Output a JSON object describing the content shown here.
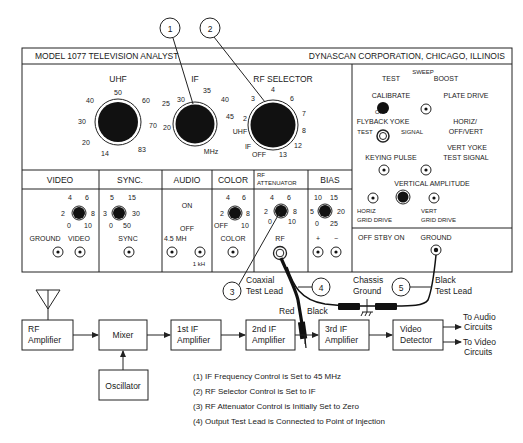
{
  "panel": {
    "model_title": "MODEL 1077 TELEVISION ANALYST",
    "maker": "DYNASCAN CORPORATION, CHICAGO, ILLINOIS",
    "uhf_dial": {
      "label": "UHF",
      "ticks": [
        "14",
        "20",
        "30",
        "40",
        "50",
        "60",
        "70",
        "83"
      ]
    },
    "if_dial": {
      "label": "IF",
      "unit": "MHz",
      "ticks": [
        "20",
        "25",
        "30",
        "35",
        "40",
        "45"
      ]
    },
    "rf_selector": {
      "label": "RF SELECTOR",
      "ticks": [
        "IF",
        "UHF",
        "2",
        "3",
        "4",
        "6",
        "7",
        "8",
        "12",
        "13"
      ],
      "off": "OFF"
    },
    "right_column": {
      "sweep": "SWEEP",
      "test": "TEST",
      "boost": "BOOST",
      "calibrate": "CALIBRATE",
      "plate_drive": "PLATE DRIVE",
      "off": "OFF",
      "flyback_yoke": "FLYBACK YOKE",
      "horiz_off_vert_1": "HORIZ/",
      "horiz_off_vert_2": "OFF/VERT",
      "test_small": "TEST",
      "signal_small": "SIGNAL",
      "vert_yoke_1": "VERT YOKE",
      "vert_yoke_2": "TEST SIGNAL",
      "keying_pulse": "KEYING PULSE",
      "vertical_amplitude": "VERTICAL AMPLITUDE",
      "horiz_grid_1": "HORIZ",
      "horiz_grid_2": "GRID DRIVE",
      "vert_grid_1": "VERT",
      "vert_grid_2": "GRID DRIVE",
      "power": "OFF STBY ON",
      "ground": "GROUND"
    },
    "sections": {
      "video": {
        "title": "VIDEO",
        "ticks": [
          "0",
          "2",
          "4",
          "6",
          "8",
          "10"
        ],
        "jack1": "GROUND",
        "jack2": "VIDEO"
      },
      "sync": {
        "title": "SYNC.",
        "ticks": [
          "0",
          "3",
          "5",
          "15",
          "30",
          "50"
        ],
        "jack": "SYNC"
      },
      "audio": {
        "title": "AUDIO",
        "on": "ON",
        "off": "OFF",
        "jack1": "4.5 MH",
        "jack2": "1 kH"
      },
      "color": {
        "title": "COLOR",
        "ticks": [
          "OFF",
          "2",
          "4",
          "6",
          "8",
          "10"
        ],
        "jack": "COLOR"
      },
      "rf_attenuator": {
        "title1": "RF",
        "title2": "ATTENUATOR",
        "ticks": [
          "0",
          "2",
          "4",
          "6",
          "8",
          "10"
        ],
        "jack": "RF"
      },
      "bias": {
        "title": "BIAS",
        "ticks": [
          "0",
          "5",
          "10",
          "15",
          "20",
          "25"
        ],
        "plus": "+",
        "minus": "−"
      }
    }
  },
  "callouts": {
    "c1": "1",
    "c2": "2",
    "c3": "3",
    "c4": "4",
    "c5": "5",
    "coaxial_1": "Coaxial",
    "coaxial_2": "Test Lead",
    "chassis_1": "Chassis",
    "chassis_2": "Ground",
    "black_lead_1": "Black",
    "black_lead_2": "Test Lead",
    "red": "Red",
    "black": "Black"
  },
  "block_diagram": {
    "blocks": [
      {
        "id": "rf_amp",
        "line1": "RF",
        "line2": "Amplifier"
      },
      {
        "id": "mixer",
        "line1": "Mixer",
        "line2": ""
      },
      {
        "id": "if1",
        "line1": "1st IF",
        "line2": "Amplifier"
      },
      {
        "id": "if2",
        "line1": "2nd IF",
        "line2": "Amplifier"
      },
      {
        "id": "if3",
        "line1": "3rd IF",
        "line2": "Amplifier"
      },
      {
        "id": "detector",
        "line1": "Video",
        "line2": "Detector"
      },
      {
        "id": "oscillator",
        "line1": "Oscillator",
        "line2": ""
      }
    ],
    "outputs": {
      "audio_1": "To Audio",
      "audio_2": "Circuits",
      "video_1": "To Video",
      "video_2": "Circuits"
    }
  },
  "notes": [
    "(1)  IF Frequency Control is Set to 45 MHz",
    "(2)  RF Selector Control is Set to IF",
    "(3)  RF Attenuator Control is Initially Set to Zero",
    "(4)  Output Test Lead is Connected to Point of Injection"
  ]
}
